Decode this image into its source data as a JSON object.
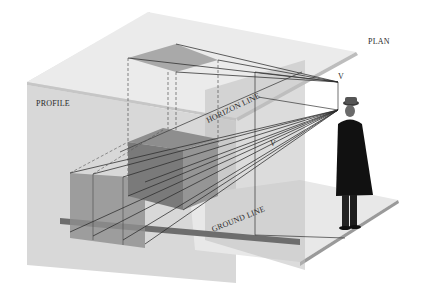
{
  "diagram": {
    "labels": {
      "plan": "PLAN",
      "profile": "PROFILE",
      "horizon_line": "HORIZON LINE",
      "ground_line": "GROUND LINE",
      "vanishing_top": "V",
      "vanishing_mid": "V"
    },
    "elements": [
      "plan-plane",
      "profile-plane",
      "picture-plane",
      "ground-plane",
      "cube-object",
      "cube-plan-projection",
      "cube-profile-projection",
      "viewer-figure",
      "projection-rays"
    ],
    "colors": {
      "background": "#ffffff",
      "plane_light": "#e6e6e6",
      "plane_mid": "#d2d2d2",
      "cube_dark": "#7e7e7e",
      "cube_mid": "#9a9a9a",
      "ray": "#2b2b2b",
      "figure": "#111111"
    }
  }
}
